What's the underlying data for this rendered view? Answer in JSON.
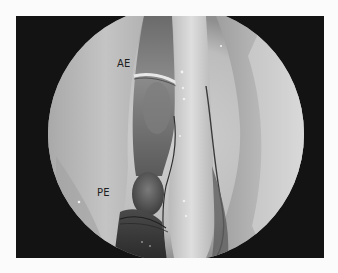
{
  "figure": {
    "type": "endoscopic-view",
    "colormode": "grayscale",
    "labels": [
      {
        "id": "ae",
        "text": "AE",
        "x": 117,
        "y": 59
      },
      {
        "id": "pe",
        "text": "PE",
        "x": 97,
        "y": 188
      }
    ]
  },
  "colors": {
    "page_bg": "#fbfbfb",
    "frame_bg": "#131313",
    "tissue_light": "#d4d4d4",
    "tissue_mid": "#9a9a9a",
    "tissue_dark": "#4a4a4a",
    "label_text": "#1d1d1d"
  }
}
